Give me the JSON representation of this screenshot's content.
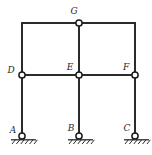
{
  "figure": {
    "name": "two-bay-rigid-frame",
    "colors": {
      "member": "#2b2b2b",
      "joint_fill": "#ffffff",
      "joint_stroke": "#1a1a1a",
      "ground": "#2b2b2b",
      "background": "#ffffff",
      "label": "#2b2b2b"
    },
    "geometry": {
      "columns_x": [
        22,
        79,
        135
      ],
      "beam_upper_y": 23,
      "beam_middle_y": 75,
      "base_y": 136,
      "member_width": 2,
      "joint_radius": 3.1
    },
    "joints": [
      {
        "id": "A",
        "label": "A",
        "x": 22,
        "y": 136,
        "label_x": 13,
        "label_y": 133,
        "type": "support"
      },
      {
        "id": "B",
        "label": "B",
        "x": 79,
        "y": 136,
        "label_x": 71,
        "label_y": 131,
        "type": "support"
      },
      {
        "id": "C",
        "label": "C",
        "x": 135,
        "y": 136,
        "label_x": 127,
        "label_y": 131,
        "type": "support"
      },
      {
        "id": "D",
        "label": "D",
        "x": 22,
        "y": 75,
        "label_x": 11,
        "label_y": 73,
        "type": "joint"
      },
      {
        "id": "E",
        "label": "E",
        "x": 79,
        "y": 75,
        "label_x": 70,
        "label_y": 70,
        "type": "joint"
      },
      {
        "id": "F",
        "label": "F",
        "x": 135,
        "y": 75,
        "label_x": 126,
        "label_y": 70,
        "type": "joint"
      },
      {
        "id": "G",
        "label": "G",
        "x": 79,
        "y": 23,
        "label_x": 74,
        "label_y": 14,
        "type": "joint"
      }
    ],
    "members": [
      {
        "id": "DG-beam-left",
        "from": "D",
        "to": "G",
        "x1": 22,
        "y1": 23,
        "x2": 79,
        "y2": 23
      },
      {
        "id": "GF-beam-right",
        "from": "G",
        "to": "F",
        "x1": 79,
        "y1": 23,
        "x2": 135,
        "y2": 23
      },
      {
        "id": "DE-beam-left",
        "from": "D",
        "to": "E",
        "x1": 22,
        "y1": 75,
        "x2": 79,
        "y2": 75
      },
      {
        "id": "EF-beam-right",
        "from": "E",
        "to": "F",
        "x1": 79,
        "y1": 75,
        "x2": 135,
        "y2": 75
      },
      {
        "id": "D-column-upper",
        "from": "D",
        "to": "top-left",
        "x1": 22,
        "y1": 23,
        "x2": 22,
        "y2": 75
      },
      {
        "id": "E-column-upper",
        "from": "E",
        "to": "G",
        "x1": 79,
        "y1": 23,
        "x2": 79,
        "y2": 75
      },
      {
        "id": "F-column-upper",
        "from": "F",
        "to": "top-right",
        "x1": 135,
        "y1": 23,
        "x2": 135,
        "y2": 75
      },
      {
        "id": "AD-column",
        "from": "A",
        "to": "D",
        "x1": 22,
        "y1": 75,
        "x2": 22,
        "y2": 136
      },
      {
        "id": "BE-column",
        "from": "B",
        "to": "E",
        "x1": 79,
        "y1": 75,
        "x2": 79,
        "y2": 136
      },
      {
        "id": "CF-column",
        "from": "C",
        "to": "F",
        "x1": 135,
        "y1": 75,
        "x2": 135,
        "y2": 136
      }
    ],
    "supports": [
      {
        "id": "support-A",
        "joint": "A",
        "x": 22,
        "y": 136,
        "ground_x1": 11,
        "ground_x2": 36,
        "hatch_count": 6
      },
      {
        "id": "support-B",
        "joint": "B",
        "x": 79,
        "y": 136,
        "ground_x1": 68,
        "ground_x2": 93,
        "hatch_count": 6
      },
      {
        "id": "support-C",
        "joint": "C",
        "x": 135,
        "y": 136,
        "ground_x1": 124,
        "ground_x2": 149,
        "hatch_count": 6
      }
    ]
  }
}
